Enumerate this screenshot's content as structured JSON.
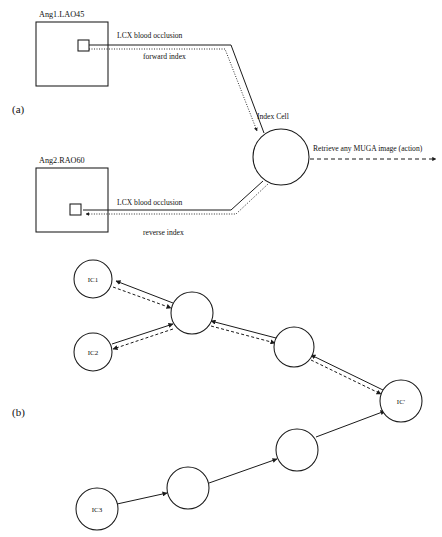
{
  "figure": {
    "panels": [
      {
        "key": "a",
        "label": "(a)",
        "x": 12,
        "y": 113
      },
      {
        "key": "b",
        "label": "(b)",
        "x": 12,
        "y": 416
      }
    ]
  },
  "panel_a": {
    "images": [
      {
        "name": "image-box-ang1",
        "label": "Ang1.LAO45",
        "label_x": 39,
        "label_y": 17,
        "rect": {
          "x": 36,
          "y": 22,
          "w": 72,
          "h": 64
        },
        "region": {
          "x": 78,
          "y": 40,
          "w": 11,
          "h": 11
        }
      },
      {
        "name": "image-box-ang2",
        "label": "Ang2.RAO60",
        "label_x": 39,
        "label_y": 163,
        "rect": {
          "x": 36,
          "y": 168,
          "w": 72,
          "h": 64
        },
        "region": {
          "x": 70,
          "y": 204,
          "w": 11,
          "h": 11
        }
      }
    ],
    "index_cell": {
      "label": "Index Cell",
      "label_x": 257,
      "label_y": 119,
      "cx": 281,
      "cy": 157,
      "r": 28
    },
    "edges": [
      {
        "name": "forward-index-edge",
        "solid_label": "LCX blood occlusion",
        "solid_label_x": 117,
        "solid_label_y": 38,
        "dotted_label": "forward index",
        "dotted_label_x": 143,
        "dotted_label_y": 59
      },
      {
        "name": "reverse-index-edge",
        "solid_label": "LCX blood occlusion",
        "solid_label_x": 117,
        "solid_label_y": 205,
        "dotted_label": "reverse index",
        "dotted_label_x": 143,
        "dotted_label_y": 235
      }
    ],
    "action": {
      "name": "retrieve-action-edge",
      "label": "Retrieve any MUGA image (action)",
      "label_x": 313,
      "label_y": 151
    }
  },
  "panel_b": {
    "nodes": [
      {
        "name": "node-ic1",
        "label": "IC1",
        "cx": 93,
        "cy": 279,
        "r": 19
      },
      {
        "name": "node-ic2",
        "label": "IC2",
        "cx": 93,
        "cy": 352,
        "r": 19
      },
      {
        "name": "node-mid1",
        "label": "",
        "cx": 192,
        "cy": 313,
        "r": 21
      },
      {
        "name": "node-mid2",
        "label": "",
        "cx": 294,
        "cy": 347,
        "r": 20
      },
      {
        "name": "node-icp",
        "label": "IC'",
        "cx": 401,
        "cy": 401,
        "r": 21
      },
      {
        "name": "node-mid3",
        "label": "",
        "cx": 297,
        "cy": 450,
        "r": 21
      },
      {
        "name": "node-mid4",
        "label": "",
        "cx": 188,
        "cy": 488,
        "r": 21
      },
      {
        "name": "node-ic3",
        "label": "IC3",
        "cx": 97,
        "cy": 509,
        "r": 21
      }
    ],
    "edge_names": [
      "edge-mid1-to-ic1-solid",
      "edge-mid1-to-ic1-dashed",
      "edge-ic2-to-mid1-solid",
      "edge-mid1-to-ic2-dashed",
      "edge-mid2-to-mid1-solid",
      "edge-mid1-to-mid2-dashed",
      "edge-icp-to-mid2-solid",
      "edge-mid2-to-icp-dashed",
      "edge-ic3-to-mid4",
      "edge-mid4-to-mid3",
      "edge-mid3-to-icp"
    ]
  },
  "colors": {
    "ink": "#1a1a1a",
    "paper": "#ffffff"
  }
}
